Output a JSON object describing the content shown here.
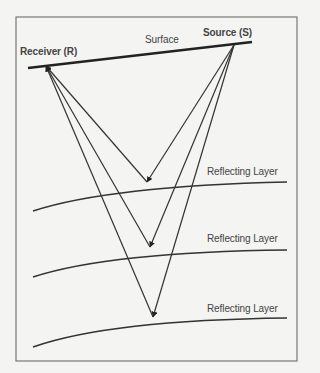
{
  "diagram": {
    "labels": {
      "receiver": "Receiver (R)",
      "source": "Source (S)",
      "surface": "Surface",
      "layers": [
        "Reflecting Layer",
        "Reflecting Layer",
        "Reflecting Layer"
      ]
    },
    "colors": {
      "background": "#f4f4f2",
      "frame": "#777777",
      "line": "#333333",
      "text": "#444444"
    },
    "geometry": {
      "frame": {
        "x": 16,
        "y": 17,
        "w": 281,
        "h": 344
      },
      "surface": {
        "x1": 28,
        "y1": 68,
        "x2": 252,
        "y2": 42
      },
      "receiver": {
        "x": 46,
        "y": 66
      },
      "source": {
        "x": 234,
        "y": 45
      },
      "layers": [
        {
          "path": "M33,211 Q110,186 287,182",
          "reflection": {
            "x": 147,
            "y": 182
          }
        },
        {
          "path": "M33,277 Q110,252 287,250",
          "reflection": {
            "x": 150,
            "y": 247
          }
        },
        {
          "path": "M33,347 Q110,320 287,318",
          "reflection": {
            "x": 153,
            "y": 317
          }
        }
      ]
    }
  }
}
